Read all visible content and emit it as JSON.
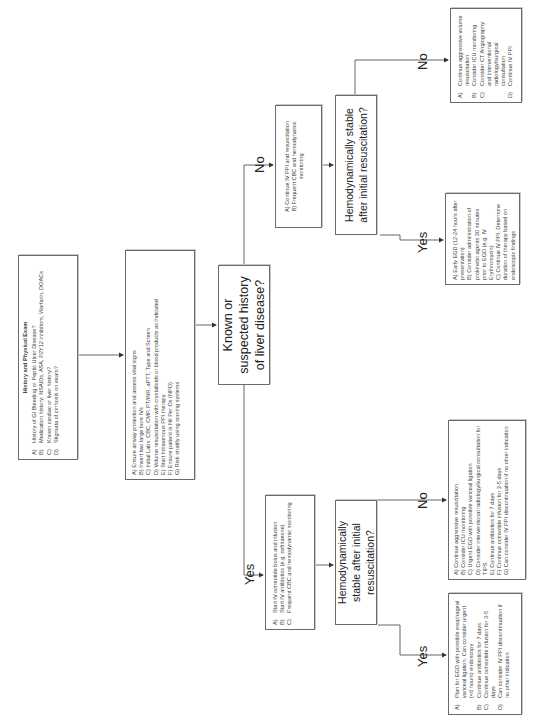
{
  "orientation": "rotated -90deg (text reads bottom-to-top)",
  "history_box": {
    "title": "History and Physical Exam",
    "items": [
      {
        "key": "A)",
        "text": "History of GI Bleeding or Peptic Ulcer Disease?"
      },
      {
        "key": "B)",
        "text": "Medication history: NSAIDs, ASA, P2Y12 inhibitors, Warfarin, DOACs"
      },
      {
        "key": "C)",
        "text": "Known cardiac or liver history?"
      },
      {
        "key": "D)",
        "text": "Stigmata of cirrhosis on exam?"
      }
    ]
  },
  "initial_management_box": {
    "items": [
      "A) Ensure airway protection and assess vital signs",
      "B) Insert two large bore IVs",
      "C) Initial Labs: CBC, CMP, PT/INR, aPTT, Type and Screen",
      "D) Volume resuscitation with crystalloids or blood products as indicated",
      "E) Start Intravenous PPI therapy",
      "F) Ensure patient is Nil Per Os (NPO)",
      "G) Risk stratify using scoring systems"
    ]
  },
  "liver_decision": {
    "text": "Known or suspected history of liver disease?"
  },
  "labels": {
    "yes": "Yes",
    "no": "No"
  },
  "no_liver_branch": {
    "management_box": {
      "items": [
        "A) Continue IV PPI and resuscitation",
        "B) Frequent CBC and hemodynamic monitoring"
      ]
    },
    "hemodynamic_decision": {
      "text": "Hemodynamically stable after initial resuscitation?"
    },
    "unstable_box": {
      "items": [
        {
          "key": "A)",
          "text": "Continue aggressive volume resuscitation"
        },
        {
          "key": "B)",
          "text": "Consider ICU monitoring"
        },
        {
          "key": "C)",
          "text": "Consider CT Angiography and interventional radiology/surgical consultation"
        },
        {
          "key": "D)",
          "text": "Continue IV PPI"
        }
      ]
    },
    "stable_box": {
      "items": [
        "A) Early EGD (12-24 hours after presentation)",
        "B) Consider administration of prokinetic agents 30 minutes prior to EGD (e.g. IV Erythromycin)",
        "C) Continue IV PPI. Determine duration of therapy based on endoscopic findings"
      ]
    }
  },
  "liver_branch": {
    "management_box": {
      "items": [
        {
          "key": "A)",
          "text": "Start IV octreotide bolus and infusion"
        },
        {
          "key": "B)",
          "text": "Start IV antibiotics (e.g. ceftriaxone)"
        },
        {
          "key": "C)",
          "text": "Frequent CBC and hemodynamic monitoring"
        }
      ]
    },
    "hemodynamic_decision": {
      "text": "Hemodynamically stable after initial resuscitation?"
    },
    "unstable_box": {
      "items": [
        "A) Continue aggressive resuscitation",
        "B) Consider ICU monitoring",
        "C) Urgent EGD with possible variceal ligation",
        "D) Consider interventional radiology/surgical consultation for TIPS",
        "E) Continue antibiotics for 7 days",
        "F) Continue octreotide infusion for 3-5 days",
        "G) Can consider IV PPI discontinuation if no other indication"
      ]
    },
    "stable_box": {
      "items": [
        {
          "key": "A)",
          "text": "Plan for EGD with possible esophageal variceal ligation. Can consider urgent (<6 hours) endoscopy"
        },
        {
          "key": "B)",
          "text": "Continue antibiotics for 7 days"
        },
        {
          "key": "C)",
          "text": "Continue octreotide infusion for 3-5 days"
        },
        {
          "key": "D)",
          "text": "Can consider IV PPI discontinuation if no other indication"
        }
      ]
    }
  },
  "colors": {
    "border": "#6a6a6a",
    "line": "#555555",
    "text": "#333333",
    "background": "#ffffff"
  }
}
